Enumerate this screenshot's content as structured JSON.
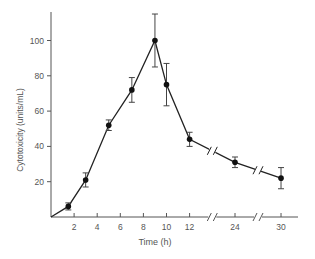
{
  "chart_data": {
    "type": "line",
    "title": "",
    "xlabel": "Time (h)",
    "ylabel": "Cytotoxicity (units/mL)",
    "ylim": [
      0,
      115
    ],
    "y_ticks": [
      20,
      40,
      60,
      80,
      100
    ],
    "x_ticks": [
      2,
      4,
      6,
      8,
      10,
      12,
      24,
      30
    ],
    "x_axis_break_after": [
      12,
      24
    ],
    "grid": false,
    "legend": null,
    "series": [
      {
        "name": "Cytotoxicity",
        "x": [
          0,
          1.5,
          3,
          5,
          7,
          9,
          10,
          12,
          24,
          30
        ],
        "values": [
          0,
          6,
          21,
          52,
          72,
          100,
          75,
          44,
          31,
          22
        ],
        "error": [
          0,
          2,
          4,
          3,
          7,
          15,
          12,
          4,
          3,
          6
        ]
      }
    ]
  },
  "labels": {
    "xlabel": "Time (h)",
    "ylabel": "Cytotoxicity (units/mL)"
  },
  "colors": {
    "axis": "#555555",
    "line": "#222222",
    "marker": "#111111"
  }
}
